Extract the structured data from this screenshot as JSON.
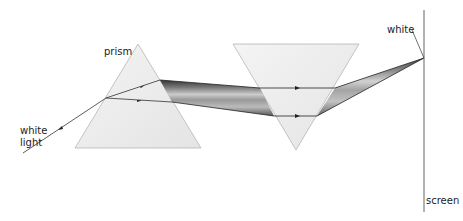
{
  "labels": {
    "prism": "prism",
    "white_light_1": "white",
    "white_light_2": "light",
    "white": "white",
    "screen": "screen"
  },
  "colors": {
    "prism_fill": "#ececec",
    "prism_edge": "#b0b0b0",
    "ray": "#333333",
    "screen": "#666666"
  }
}
